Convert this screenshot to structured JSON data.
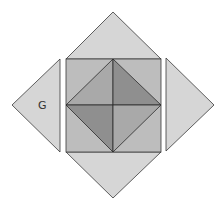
{
  "diagram": {
    "labels": {
      "left_triangle": "G"
    },
    "colors": {
      "outer_triangles": "#d6d6d6",
      "square": "#bdbdbd",
      "inner_light": "#a9a9a9",
      "inner_dark": "#8f8f8f",
      "stroke": "#3a3a3a"
    },
    "shapes": {
      "top_triangle": "66,59 161,59 113,12",
      "bottom_triangle": "66,152 161,152 113,198",
      "left_triangle": "60,59 60,152 12,105",
      "right_triangle": "166,58 166,151 214,105",
      "square": {
        "x": 66,
        "y": 59,
        "w": 95,
        "h": 93
      },
      "inner_tl": "113,59 66,105 113,105",
      "inner_tr": "113,59 161,105 113,105",
      "inner_bl": "66,105 113,152 113,105",
      "inner_br": "161,105 113,152 113,105"
    }
  }
}
